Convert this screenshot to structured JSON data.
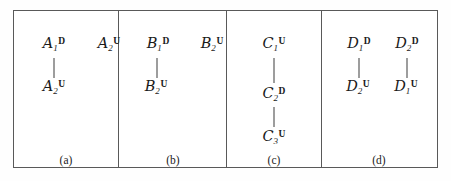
{
  "figure": {
    "frame": {
      "x": 13,
      "y": 10,
      "width": 425,
      "height": 158
    },
    "border_color": "#595959",
    "line_color": "#3c3c3c",
    "background": "#ffffff",
    "panel_dividers_x": [
      104,
      212,
      307
    ]
  },
  "panels": [
    {
      "id": "panel-a",
      "caption": "(a)",
      "caption_x": 52,
      "caption_y": 143,
      "left": 0,
      "width": 104,
      "nodes": [
        {
          "id": "a1d",
          "letter": "A",
          "sub": "1",
          "sup": "D",
          "x": 40,
          "y": 34
        },
        {
          "id": "a2u-child",
          "letter": "A",
          "sub": "2",
          "sup": "U",
          "x": 40,
          "y": 77
        },
        {
          "id": "a2u-isolated",
          "letter": "A",
          "sub": "2",
          "sup": "U",
          "x": 95,
          "y": 34
        }
      ],
      "connectors": [
        {
          "id": "a1d-a2u",
          "x": 40,
          "y": 47,
          "length": 20
        }
      ]
    },
    {
      "id": "panel-b",
      "caption": "(b)",
      "caption_x": 159,
      "caption_y": 143,
      "left": 104,
      "width": 108,
      "nodes": [
        {
          "id": "b1d",
          "letter": "B",
          "sub": "1",
          "sup": "D",
          "x": 144,
          "y": 34
        },
        {
          "id": "b2u-child",
          "letter": "B",
          "sub": "2",
          "sup": "U",
          "x": 142,
          "y": 77
        },
        {
          "id": "b2u-isolated",
          "letter": "B",
          "sub": "2",
          "sup": "U",
          "x": 198,
          "y": 34
        }
      ],
      "connectors": [
        {
          "id": "b1d-b2u",
          "x": 143,
          "y": 47,
          "length": 20
        }
      ]
    },
    {
      "id": "panel-c",
      "caption": "(c)",
      "caption_x": 260,
      "caption_y": 143,
      "left": 212,
      "width": 95,
      "nodes": [
        {
          "id": "c1u",
          "letter": "C",
          "sub": "1",
          "sup": "U",
          "x": 260,
          "y": 34
        },
        {
          "id": "c2d",
          "letter": "C",
          "sub": "2",
          "sup": "D",
          "x": 260,
          "y": 84
        },
        {
          "id": "c3u",
          "letter": "C",
          "sub": "3",
          "sup": "U",
          "x": 260,
          "y": 127
        }
      ],
      "connectors": [
        {
          "id": "c1u-c2d",
          "x": 260,
          "y": 47,
          "length": 25
        },
        {
          "id": "c2d-c3u",
          "x": 260,
          "y": 96,
          "length": 20
        }
      ]
    },
    {
      "id": "panel-d",
      "caption": "(d)",
      "caption_x": 365,
      "caption_y": 143,
      "left": 307,
      "width": 118,
      "nodes": [
        {
          "id": "d1d",
          "letter": "D",
          "sub": "1",
          "sup": "D",
          "x": 345,
          "y": 34
        },
        {
          "id": "d2d",
          "letter": "D",
          "sub": "2",
          "sup": "D",
          "x": 393,
          "y": 34
        },
        {
          "id": "d2u",
          "letter": "D",
          "sub": "2",
          "sup": "U",
          "x": 344,
          "y": 77
        },
        {
          "id": "d1u",
          "letter": "D",
          "sub": "1",
          "sup": "U",
          "x": 392,
          "y": 77
        }
      ],
      "connectors": [
        {
          "id": "d1d-d2u",
          "x": 345,
          "y": 47,
          "length": 20
        },
        {
          "id": "d2d-d1u",
          "x": 393,
          "y": 47,
          "length": 20
        }
      ]
    }
  ]
}
